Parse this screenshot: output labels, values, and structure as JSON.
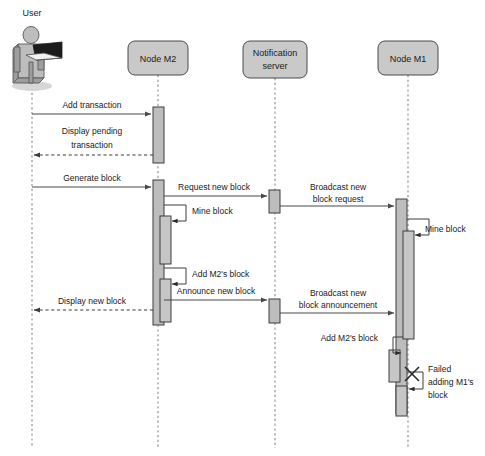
{
  "diagram": {
    "kind": "uml-sequence-diagram",
    "title": "",
    "colors": {
      "header_fill": "#c9c9c9",
      "activation_fill": "#bdbdbd",
      "line": "#4a4a4a",
      "text": "#1a1a1a",
      "actor_fill": "#bdbdbd",
      "laptop": "#1c1c1c"
    }
  },
  "participants": [
    {
      "id": "user",
      "label": "User",
      "label_lines": [
        "User"
      ],
      "type": "actor",
      "x": 32,
      "header_y": 8
    },
    {
      "id": "m2",
      "label": "Node M2",
      "label_lines": [
        "Node M2"
      ],
      "type": "lifeline",
      "x": 158,
      "header_y": 41
    },
    {
      "id": "notif",
      "label": "Notification server",
      "label_lines": [
        "Notification",
        "server"
      ],
      "type": "lifeline",
      "x": 275,
      "header_y": 41
    },
    {
      "id": "m1",
      "label": "Node M1",
      "label_lines": [
        "Node M1"
      ],
      "type": "lifeline",
      "x": 408,
      "header_y": 41
    }
  ],
  "messages": [
    {
      "id": "m01",
      "label": "Add transaction",
      "label_lines": [
        "Add transaction"
      ],
      "from": "user",
      "to": "m2",
      "style": "solid",
      "y": 114
    },
    {
      "id": "m02",
      "label": "Display pending transaction",
      "label_lines": [
        "Display pending",
        "transaction"
      ],
      "from": "m2",
      "to": "user",
      "style": "dashed",
      "y": 155
    },
    {
      "id": "m03",
      "label": "Generate block",
      "label_lines": [
        "Generate block"
      ],
      "from": "user",
      "to": "m2",
      "style": "solid",
      "y": 187
    },
    {
      "id": "m04",
      "label": "Request new block",
      "label_lines": [
        "Request new block"
      ],
      "from": "m2",
      "to": "notif",
      "style": "solid",
      "y": 196
    },
    {
      "id": "m05",
      "label": "Broadcast new block request",
      "label_lines": [
        "Broadcast new",
        "block request"
      ],
      "from": "notif",
      "to": "m1",
      "style": "solid",
      "y": 206
    },
    {
      "id": "m06",
      "label": "Mine block",
      "label_lines": [
        "Mine block"
      ],
      "from": "m2",
      "to": "m2",
      "style": "self",
      "y": 208
    },
    {
      "id": "m07",
      "label": "Mine block",
      "label_lines": [
        "Mine block"
      ],
      "from": "m1",
      "to": "m1",
      "style": "self",
      "y": 224
    },
    {
      "id": "m08",
      "label": "Add M2's block",
      "label_lines": [
        "Add M2's block"
      ],
      "from": "m2",
      "to": "m2",
      "style": "self",
      "y": 272
    },
    {
      "id": "m09",
      "label": "Announce new block",
      "label_lines": [
        "Announce new block"
      ],
      "from": "m2",
      "to": "notif",
      "style": "solid",
      "y": 300
    },
    {
      "id": "m10",
      "label": "Display new block",
      "label_lines": [
        "Display new block"
      ],
      "from": "m2",
      "to": "user",
      "style": "dashed",
      "y": 310
    },
    {
      "id": "m11",
      "label": "Broadcast new block announcement",
      "label_lines": [
        "Broadcast new",
        "block announcement"
      ],
      "from": "notif",
      "to": "m1",
      "style": "solid",
      "y": 313
    },
    {
      "id": "m12",
      "label": "Add M2's block",
      "label_lines": [
        "Add M2's block"
      ],
      "from": "m1",
      "to": "m1",
      "style": "self",
      "y": 347
    },
    {
      "id": "m13",
      "label": "Failed adding M1's block",
      "label_lines": [
        "Failed",
        "adding M1's",
        "block"
      ],
      "from": "m1",
      "to": "m1",
      "style": "self-failed",
      "y": 384
    }
  ],
  "activations": [
    {
      "id": "a-m2-1",
      "participant": "m2",
      "x": 153,
      "y": 107,
      "w": 11,
      "h": 56,
      "level": 0
    },
    {
      "id": "a-m2-2",
      "participant": "m2",
      "x": 153,
      "y": 180,
      "w": 11,
      "h": 145,
      "level": 0
    },
    {
      "id": "a-m2-mine",
      "participant": "m2",
      "x": 160,
      "y": 216,
      "w": 11,
      "h": 48,
      "level": 1
    },
    {
      "id": "a-m2-add",
      "participant": "m2",
      "x": 160,
      "y": 279,
      "w": 11,
      "h": 43,
      "level": 1
    },
    {
      "id": "a-nt-1",
      "participant": "notif",
      "x": 269,
      "y": 190,
      "w": 11,
      "h": 23,
      "level": 0
    },
    {
      "id": "a-nt-2",
      "participant": "notif",
      "x": 269,
      "y": 299,
      "w": 11,
      "h": 24,
      "level": 0
    },
    {
      "id": "a-m1-1",
      "participant": "m1",
      "x": 396,
      "y": 199,
      "w": 11,
      "h": 215,
      "level": 0
    },
    {
      "id": "a-m1-mine",
      "participant": "m1",
      "x": 403,
      "y": 231,
      "w": 11,
      "h": 108,
      "level": 1
    },
    {
      "id": "a-m1-add",
      "participant": "m1",
      "x": 389,
      "y": 350,
      "w": 11,
      "h": 32,
      "level": 1
    },
    {
      "id": "a-m1-fail",
      "participant": "m1",
      "x": 396,
      "y": 386,
      "w": 11,
      "h": 30,
      "level": 1
    }
  ],
  "annotations": {
    "failure_marker": "x-mark"
  }
}
